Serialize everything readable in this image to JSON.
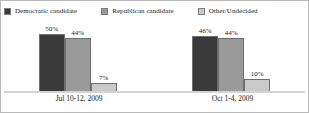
{
  "chart_data": {
    "type": "bar",
    "title": "",
    "subtitle": "",
    "xlabel": "",
    "ylabel": "",
    "ylim": [
      0,
      55
    ],
    "grid": false,
    "legend_position": "top-left",
    "categories": [
      "Jul 10-12, 2009",
      "Oct 1-4, 2009"
    ],
    "series": [
      {
        "name": "Democratic candidate",
        "color": "#3a3a3a",
        "values": [
          50,
          46
        ],
        "labels": [
          "50%",
          "44%"
        ]
      },
      {
        "name": "Republican candidate",
        "color": "#9a9a9a",
        "values": [
          44,
          44
        ],
        "labels": [
          "44%",
          "44%"
        ]
      },
      {
        "name": "Other/Undecided",
        "color": "#c9c9c9",
        "values": [
          7,
          10
        ],
        "labels": [
          "7%",
          "10%"
        ]
      }
    ],
    "groups": [
      {
        "category": "Jul 10-12, 2009",
        "bars": [
          {
            "series": "Democratic candidate",
            "value": 50,
            "label": "50%",
            "color": "#3a3a3a"
          },
          {
            "series": "Republican candidate",
            "value": 44,
            "label": "44%",
            "color": "#9a9a9a"
          },
          {
            "series": "Other/Undecided",
            "value": 7,
            "label": "7%",
            "color": "#c9c9c9"
          }
        ]
      },
      {
        "category": "Oct 1-4, 2009",
        "bars": [
          {
            "series": "Democratic candidate",
            "value": 46,
            "label": "46%",
            "color": "#3a3a3a"
          },
          {
            "series": "Republican candidate",
            "value": 44,
            "label": "44%",
            "color": "#9a9a9a"
          },
          {
            "series": "Other/Undecided",
            "value": 10,
            "label": "10%",
            "color": "#c9c9c9"
          }
        ]
      }
    ]
  },
  "legend": {
    "items": [
      {
        "label": "Democratic candidate",
        "color": "#3a3a3a"
      },
      {
        "label": "Republican candidate",
        "color": "#9a9a9a"
      },
      {
        "label": "Other/Undecided",
        "color": "#c9c9c9"
      }
    ]
  },
  "axis": {
    "categories": [
      "Jul 10-12, 2009",
      "Oct 1-4, 2009"
    ]
  },
  "style": {
    "border_color": "#b9b9b9",
    "baseline_color": "#d4d4d4",
    "bar_outline": "#6f6f6f",
    "text_color": "#1c1c1c"
  }
}
